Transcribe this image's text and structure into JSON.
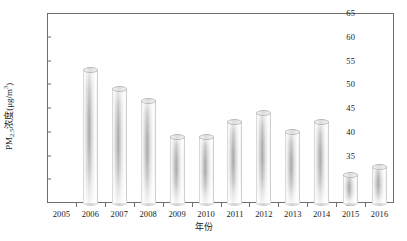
{
  "chart_data": {
    "type": "bar",
    "title": "",
    "xlabel": "年份",
    "ylabel_html": "PM2.5浓度(μg/m3)",
    "ylabel_main": "PM",
    "ylabel_sub": "2.5",
    "ylabel_mid": "浓度(μg/m",
    "ylabel_sup": "3",
    "ylabel_end": ")",
    "categories": [
      "2005",
      "2006",
      "2007",
      "2008",
      "2009",
      "2010",
      "2011",
      "2012",
      "2013",
      "2014",
      "2015",
      "2016"
    ],
    "values": [
      null,
      53.0,
      49.0,
      46.5,
      39.0,
      39.0,
      42.0,
      44.0,
      40.0,
      42.0,
      31.0,
      32.5
    ],
    "ylim": [
      25,
      65
    ],
    "yticks": [
      25,
      30,
      35,
      40,
      45,
      50,
      55,
      60,
      65
    ],
    "ytick_labels": [
      "25",
      "30",
      "35",
      "40",
      "45",
      "50",
      "55",
      "60",
      "65"
    ],
    "grid": false,
    "legend": null,
    "bar_style": "3d-cylinder",
    "bar_color": "#c9c9c9"
  },
  "colors": {
    "axis": "#6f6f6f",
    "text": "#1a1a1a",
    "background": "#ffffff"
  }
}
